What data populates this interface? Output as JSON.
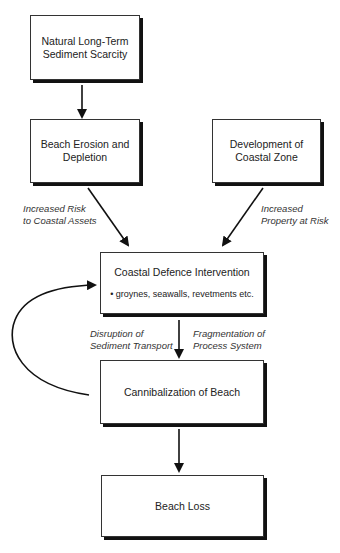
{
  "diagram": {
    "nodes": {
      "sediment_scarcity": {
        "lines": [
          "Natural Long-Term",
          "Sediment Scarcity"
        ]
      },
      "beach_erosion": {
        "lines": [
          "Beach Erosion and",
          "Depletion"
        ]
      },
      "coastal_development": {
        "lines": [
          "Development of",
          "Coastal Zone"
        ]
      },
      "defence_intervention": {
        "title": "Coastal Defence Intervention",
        "bullet": "• groynes, seawalls, revetments etc."
      },
      "cannibalization": {
        "title": "Cannibalization of Beach"
      },
      "beach_loss": {
        "title": "Beach Loss"
      }
    },
    "edge_labels": {
      "risk_assets": [
        "Increased Risk",
        "to Coastal Assets"
      ],
      "property_risk": [
        "Increased",
        "Property at Risk"
      ],
      "sediment_transport": [
        "Disruption of",
        "Sediment Transport"
      ],
      "process_fragmentation": [
        "Fragmentation of",
        "Process System"
      ]
    },
    "edges": [
      {
        "from": "sediment_scarcity",
        "to": "beach_erosion"
      },
      {
        "from": "beach_erosion",
        "to": "defence_intervention",
        "label": "risk_assets"
      },
      {
        "from": "coastal_development",
        "to": "defence_intervention",
        "label": "property_risk"
      },
      {
        "from": "defence_intervention",
        "to": "cannibalization",
        "label": "sediment_transport + process_fragmentation"
      },
      {
        "from": "cannibalization",
        "to": "defence_intervention",
        "type": "feedback-curve"
      },
      {
        "from": "cannibalization",
        "to": "beach_loss"
      }
    ],
    "colors": {
      "line": "#111111",
      "box_border": "#333333",
      "shadow": "#111111",
      "background": "#ffffff"
    }
  }
}
